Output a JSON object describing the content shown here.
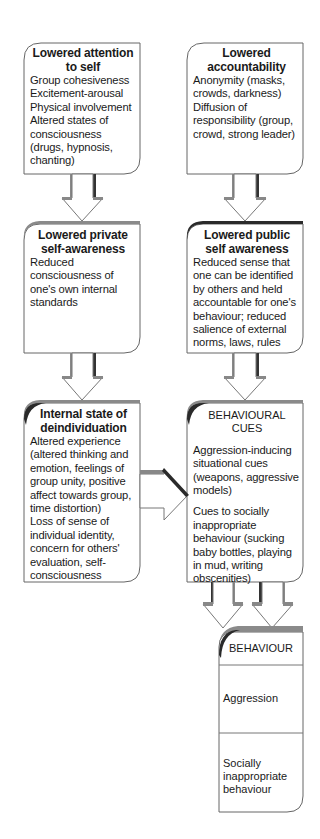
{
  "diagram": {
    "nodes": {
      "attention": {
        "title": [
          "Lowered attention",
          "to self"
        ],
        "lines": [
          "Group cohesiveness",
          "Excitement-arousal",
          "Physical involvement",
          "Altered states of",
          "consciousness",
          "(drugs, hypnosis,",
          "chanting)"
        ]
      },
      "accountability": {
        "title": [
          "Lowered",
          "accountability"
        ],
        "lines": [
          "Anonymity (masks,",
          "crowds, darkness)",
          "Diffusion of",
          "responsibility (group,",
          "crowd, strong leader)"
        ]
      },
      "private": {
        "title": [
          "Lowered private",
          "self-awareness"
        ],
        "lines": [
          "Reduced",
          "consciousness of",
          "one's own internal",
          "standards"
        ]
      },
      "public": {
        "title": [
          "Lowered public",
          "self awareness"
        ],
        "lines": [
          "Reduced sense that",
          "one can be identified",
          "by others and held",
          "accountable for one's",
          "behaviour; reduced",
          "salience of external",
          "norms, laws, rules"
        ]
      },
      "internal": {
        "title": [
          "Internal state of",
          "deindividuation"
        ],
        "lines": [
          "Altered experience",
          "(altered thinking and",
          "emotion, feelings of",
          "group unity, positive",
          "affect towards group,",
          "time distortion)",
          "Loss of sense of",
          "individual identity,",
          "concern for others'",
          "evaluation, self-",
          "consciousness"
        ]
      },
      "cues": {
        "title": "BEHAVIOURAL CUES",
        "group1": [
          "Aggression-inducing",
          "situational cues",
          "(weapons, aggressive",
          "models)"
        ],
        "group2": [
          "Cues to socially",
          "inappropriate",
          "behaviour (sucking",
          "baby bottles, playing",
          "in mud, writing",
          "obscenities)"
        ]
      },
      "behaviour": {
        "title": "BEHAVIOUR",
        "outcomes": [
          "Aggression",
          [
            "Socially inappropriate",
            "behaviour"
          ]
        ]
      }
    },
    "edges": [
      {
        "from": "attention",
        "to": "private"
      },
      {
        "from": "accountability",
        "to": "public"
      },
      {
        "from": "private",
        "to": "internal"
      },
      {
        "from": "public",
        "to": "cues"
      },
      {
        "from": "internal",
        "to": "cues"
      },
      {
        "from": "cues",
        "to": "behaviour",
        "count": 2
      }
    ],
    "colors": {
      "border": "#555555",
      "shadow": "#8a8a8a",
      "dark_shadow": "#2a2a2a",
      "fill": "#ffffff",
      "text": "#1a1a1a"
    }
  }
}
